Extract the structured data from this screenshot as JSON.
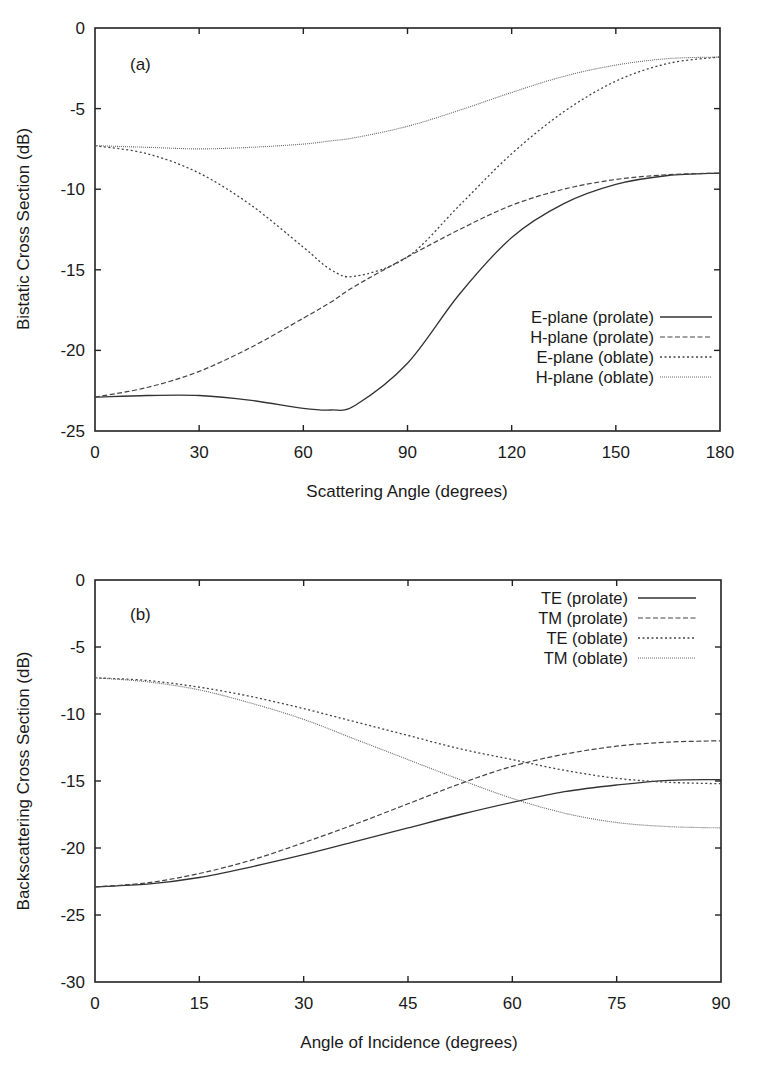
{
  "chart_data": [
    {
      "type": "line",
      "panel_label": "(a)",
      "title": "",
      "xlabel": "Scattering Angle (degrees)",
      "ylabel": "Bistatic Cross Section (dB)",
      "xlim": [
        0,
        180
      ],
      "ylim": [
        -25,
        0
      ],
      "xticks": [
        "0",
        "30",
        "60",
        "90",
        "120",
        "150",
        "180"
      ],
      "yticks": [
        "0",
        "-5",
        "-10",
        "-15",
        "-20",
        "-25"
      ],
      "grid": false,
      "legend_position": "lower right",
      "x": [
        0,
        15,
        30,
        45,
        60,
        68,
        75,
        90,
        105,
        120,
        135,
        150,
        165,
        180
      ],
      "series": [
        {
          "name": "E-plane (prolate)",
          "style": "solid",
          "values": [
            -22.9,
            -22.8,
            -22.8,
            -23.1,
            -23.6,
            -23.7,
            -23.4,
            -20.8,
            -16.5,
            -13.0,
            -10.9,
            -9.7,
            -9.15,
            -9.0
          ]
        },
        {
          "name": "H-plane (prolate)",
          "style": "dashed",
          "values": [
            -22.9,
            -22.3,
            -21.3,
            -19.8,
            -18.0,
            -17.0,
            -16.0,
            -14.2,
            -12.5,
            -11.0,
            -10.0,
            -9.4,
            -9.1,
            -9.0
          ]
        },
        {
          "name": "E-plane (oblate)",
          "style": "dotted",
          "values": [
            -7.3,
            -7.8,
            -9.0,
            -11.0,
            -13.6,
            -15.0,
            -15.4,
            -14.2,
            -11.0,
            -7.8,
            -5.2,
            -3.3,
            -2.2,
            -1.8
          ]
        },
        {
          "name": "H-plane (oblate)",
          "style": "fine-dotted",
          "values": [
            -7.3,
            -7.4,
            -7.5,
            -7.4,
            -7.2,
            -7.0,
            -6.8,
            -6.1,
            -5.1,
            -4.0,
            -3.0,
            -2.3,
            -1.9,
            -1.8
          ]
        }
      ]
    },
    {
      "type": "line",
      "panel_label": "(b)",
      "title": "",
      "xlabel": "Angle of Incidence (degrees)",
      "ylabel": "Backscattering Cross Section (dB)",
      "xlim": [
        0,
        90
      ],
      "ylim": [
        -30,
        0
      ],
      "xticks": [
        "0",
        "15",
        "30",
        "45",
        "60",
        "75",
        "90"
      ],
      "yticks": [
        "0",
        "-5",
        "-10",
        "-15",
        "-20",
        "-25",
        "-30"
      ],
      "grid": false,
      "legend_position": "upper right",
      "x": [
        0,
        7.5,
        15,
        22.5,
        30,
        37.5,
        45,
        52.5,
        60,
        67.5,
        75,
        82.5,
        90
      ],
      "series": [
        {
          "name": "TE (prolate)",
          "style": "solid",
          "values": [
            -22.9,
            -22.7,
            -22.2,
            -21.4,
            -20.5,
            -19.5,
            -18.5,
            -17.5,
            -16.6,
            -15.8,
            -15.3,
            -14.95,
            -14.9
          ]
        },
        {
          "name": "TM (prolate)",
          "style": "dashed",
          "values": [
            -22.9,
            -22.6,
            -21.9,
            -20.9,
            -19.6,
            -18.2,
            -16.7,
            -15.2,
            -13.9,
            -13.0,
            -12.4,
            -12.1,
            -12.0
          ]
        },
        {
          "name": "TE (oblate)",
          "style": "dotted",
          "values": [
            -7.3,
            -7.5,
            -8.0,
            -8.7,
            -9.6,
            -10.6,
            -11.6,
            -12.6,
            -13.4,
            -14.2,
            -14.8,
            -15.1,
            -15.2
          ]
        },
        {
          "name": "TM (oblate)",
          "style": "fine-dotted",
          "values": [
            -7.3,
            -7.6,
            -8.2,
            -9.2,
            -10.4,
            -11.9,
            -13.4,
            -14.9,
            -16.3,
            -17.4,
            -18.1,
            -18.4,
            -18.5
          ]
        }
      ]
    }
  ]
}
